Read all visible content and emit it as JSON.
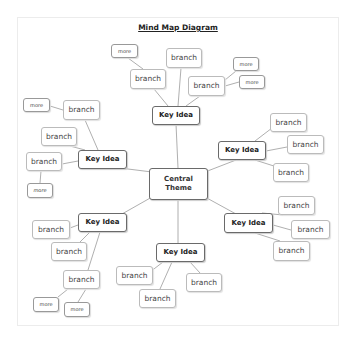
{
  "title": "Mind Map Diagram",
  "central": {
    "label": "Central Theme",
    "line1": "Central",
    "line2": "Theme"
  },
  "labels": {
    "key": "Key Idea",
    "branch": "branch",
    "more": "more"
  },
  "key_ideas": [
    {
      "id": "top",
      "label": "Key Idea",
      "branches": [
        "branch",
        "branch",
        "branch"
      ],
      "more": [
        "more",
        "more",
        "more"
      ]
    },
    {
      "id": "left",
      "label": "Key Idea",
      "branches": [
        "branch",
        "branch",
        "branch"
      ],
      "more": [
        "more",
        "more"
      ]
    },
    {
      "id": "right",
      "label": "Key Idea",
      "branches": [
        "branch",
        "branch",
        "branch"
      ],
      "more": []
    },
    {
      "id": "bottom-left",
      "label": "Key Idea",
      "branches": [
        "branch",
        "branch",
        "branch"
      ],
      "more": [
        "more",
        "more"
      ]
    },
    {
      "id": "bottom",
      "label": "Key Idea",
      "branches": [
        "branch",
        "branch",
        "branch"
      ],
      "more": []
    },
    {
      "id": "bottom-right",
      "label": "Key Idea",
      "branches": [
        "branch",
        "branch",
        "branch"
      ],
      "more": []
    }
  ],
  "colors": {
    "line": "#9a9a9a",
    "key_border": "#6a6a6a",
    "branch_border": "#bbbbbb"
  }
}
